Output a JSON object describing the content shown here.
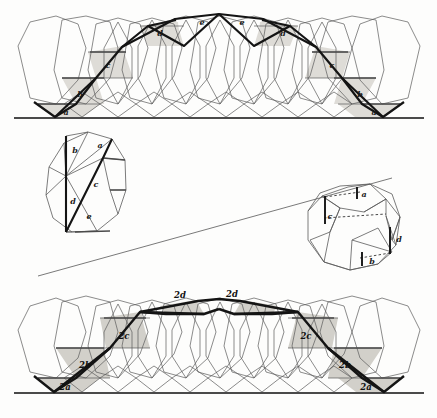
{
  "figure": {
    "background": "#fdfdfc",
    "colors": {
      "shade_light": "#dedcd7",
      "shade_mid": "#d2d0ca",
      "thin_line": "#5a5a5a",
      "thick_line": "#141414",
      "baseline": "#4a4a4a",
      "dashed": "#333333"
    },
    "panels": [
      {
        "id": "top-band",
        "caption_labels": [
          "a",
          "b",
          "c",
          "d",
          "e",
          "e",
          "d",
          "c",
          "b",
          "a"
        ]
      },
      {
        "id": "mid-left-polygon",
        "caption_labels": [
          "a",
          "b",
          "c",
          "d",
          "e"
        ]
      },
      {
        "id": "mid-right-polygon",
        "caption_labels": [
          "a",
          "b",
          "c",
          "d"
        ]
      },
      {
        "id": "bottom-band",
        "caption_labels": [
          "2a",
          "2b",
          "2c",
          "2d",
          "2d",
          "2c",
          "2b",
          "2a"
        ]
      }
    ]
  },
  "top_band": {
    "labels": [
      {
        "text": "a",
        "x": 66,
        "y": 113
      },
      {
        "text": "b",
        "x": 80,
        "y": 95
      },
      {
        "text": "c",
        "x": 108,
        "y": 66
      },
      {
        "text": "d",
        "x": 160,
        "y": 34
      },
      {
        "text": "e",
        "x": 202,
        "y": 23
      },
      {
        "text": "e",
        "x": 242,
        "y": 23
      },
      {
        "text": "d",
        "x": 283,
        "y": 34
      },
      {
        "text": "c",
        "x": 332,
        "y": 66
      },
      {
        "text": "b",
        "x": 360,
        "y": 95
      },
      {
        "text": "a",
        "x": 374,
        "y": 113
      }
    ]
  },
  "mid_left": {
    "labels": [
      {
        "text": "b",
        "x": 75,
        "y": 151
      },
      {
        "text": "a",
        "x": 100,
        "y": 146
      },
      {
        "text": "c",
        "x": 96,
        "y": 185
      },
      {
        "text": "d",
        "x": 73,
        "y": 202
      },
      {
        "text": "e",
        "x": 89,
        "y": 217
      }
    ]
  },
  "mid_right": {
    "labels": [
      {
        "text": "a",
        "x": 362,
        "y": 196
      },
      {
        "text": "c",
        "x": 328,
        "y": 219
      },
      {
        "text": "d",
        "x": 399,
        "y": 240
      },
      {
        "text": "b",
        "x": 372,
        "y": 259
      }
    ]
  },
  "bottom_band": {
    "labels": [
      {
        "text": "2a",
        "x": 65,
        "y": 392
      },
      {
        "text": "2b",
        "x": 85,
        "y": 367
      },
      {
        "text": "2c",
        "x": 124,
        "y": 338
      },
      {
        "text": "2d",
        "x": 180,
        "y": 297
      },
      {
        "text": "2d",
        "x": 232,
        "y": 296
      },
      {
        "text": "2c",
        "x": 306,
        "y": 338
      },
      {
        "text": "2b",
        "x": 345,
        "y": 367
      },
      {
        "text": "2a",
        "x": 366,
        "y": 392
      }
    ]
  }
}
